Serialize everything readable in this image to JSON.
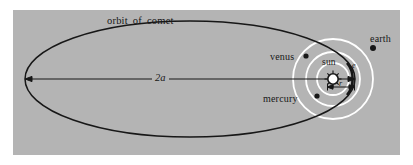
{
  "figure": {
    "type": "astronomy-orbit-diagram",
    "background_color": "#ffffff",
    "panel_color": "#b4b4b4",
    "ink_color": "#171717",
    "orbit_color": "#ffffff"
  },
  "labels": {
    "orbit_of_comet": {
      "w1": "orbit",
      "w2": "of",
      "w3": "comet"
    },
    "major_axis": "2a",
    "sun": "sun",
    "mercury": "mercury",
    "venus": "venus",
    "earth": "earth",
    "radius": "r",
    "eccentric": "e"
  },
  "objects": {
    "sun": {
      "cx": 333,
      "cy": 79,
      "r": 5.5,
      "fill": "#ffffff"
    },
    "mercury": {
      "cx": 317,
      "cy": 96,
      "r": 2.6
    },
    "venus": {
      "cx": 306,
      "cy": 56,
      "r": 2.6
    },
    "earth": {
      "cx": 373,
      "cy": 48,
      "r": 3.0
    }
  },
  "orbits": {
    "mercury_radius": 16,
    "venus_radius": 27,
    "earth_radius": 40,
    "comet": {
      "cx": 190,
      "cy": 79,
      "rx": 165,
      "ry": 58
    }
  },
  "axis": {
    "label": "2a",
    "x1": 25,
    "x2": 355,
    "y": 79
  },
  "dimension_r": {
    "x1": 327,
    "x2": 355,
    "y": 87
  }
}
